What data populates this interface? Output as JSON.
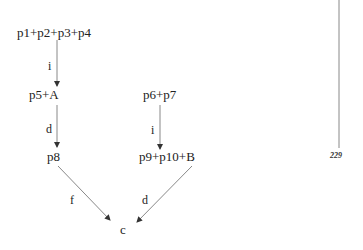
{
  "diagram": {
    "nodes": {
      "n1": "p1+p2+p3+p4",
      "n2": "p5+A",
      "n3": "p8",
      "n4": "p6+p7",
      "n5": "p9+p10+B",
      "n6": "c"
    },
    "edges": [
      {
        "from": "p1+p2+p3+p4",
        "to": "p5+A",
        "label": "i"
      },
      {
        "from": "p5+A",
        "to": "p8",
        "label": "d"
      },
      {
        "from": "p6+p7",
        "to": "p9+p10+B",
        "label": "i"
      },
      {
        "from": "p8",
        "to": "c",
        "label": "f"
      },
      {
        "from": "p9+p10+B",
        "to": "c",
        "label": "d"
      }
    ],
    "edge_labels": {
      "e1": "i",
      "e2": "d",
      "e3": "i",
      "e4": "f",
      "e5": "d"
    },
    "page_number": "229",
    "colors": {
      "line": "#888888",
      "text": "#222222"
    }
  }
}
